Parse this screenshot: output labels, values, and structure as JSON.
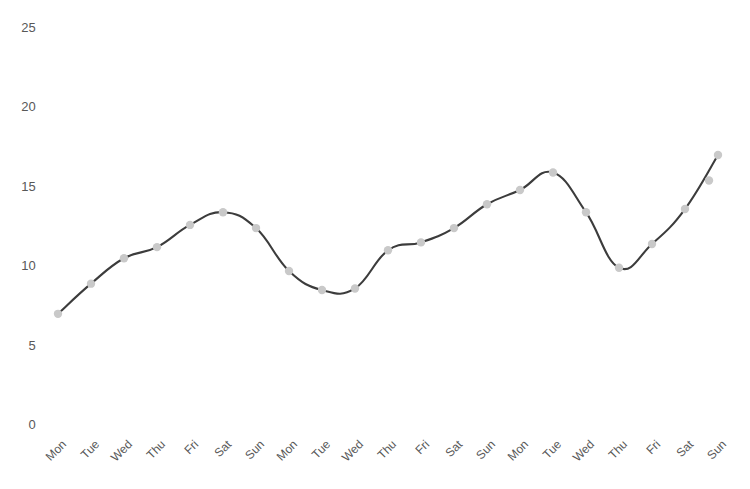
{
  "chart_data": {
    "type": "line",
    "title": "",
    "subtitle": "",
    "xlabel": "",
    "ylabel": "",
    "ylim": [
      0,
      25
    ],
    "grid": false,
    "legend": null,
    "y_ticks": [
      25,
      20,
      15,
      10,
      5,
      0
    ],
    "y_tick_labels": [
      "25",
      "20",
      "15",
      "10",
      "5",
      "0"
    ],
    "categories": [
      "Mon",
      "Tue",
      "Wed",
      "Thu",
      "Fri",
      "Sat",
      "Sun",
      "Mon",
      "Tue",
      "Wed",
      "Thu",
      "Fri",
      "Sat",
      "Sun",
      "Mon",
      "Tue",
      "Wed",
      "Thu",
      "Fri",
      "Sat",
      "Sun"
    ],
    "series": [
      {
        "name": "value",
        "marker": "circle",
        "marker_color": "#c9c9c9",
        "line_color": "#3c3c3c",
        "smoothing": "spline",
        "values": [
          7.0,
          8.9,
          10.5,
          11.2,
          12.6,
          13.4,
          12.4,
          9.7,
          8.5,
          8.6,
          11.0,
          11.5,
          12.4,
          13.9,
          14.8,
          15.9,
          13.4,
          9.9,
          11.4,
          13.6,
          17.0
        ]
      }
    ],
    "x_pixels": [
      58,
      95,
      139,
      175,
      200,
      237,
      250,
      277,
      292,
      328,
      360,
      378,
      394,
      430,
      455,
      473,
      510,
      536,
      594,
      634,
      688
    ],
    "marker_points": [
      {
        "label": "Mon",
        "value": 7.0
      },
      {
        "label": "Tue",
        "value": 8.9
      },
      {
        "label": "Wed",
        "value": 10.5
      },
      {
        "label": "Thu",
        "value": 11.2
      },
      {
        "label": "Fri",
        "value": 12.6
      },
      {
        "label": "Sat",
        "value": 13.4
      },
      {
        "label": "Sun",
        "value": 12.4
      },
      {
        "label": "Mon",
        "value": 9.7
      },
      {
        "label": "Tue",
        "value": 8.5
      },
      {
        "label": "Wed",
        "value": 8.6
      },
      {
        "label": "Thu",
        "value": 11.0
      },
      {
        "label": "Fri",
        "value": 11.5
      },
      {
        "label": "Sat",
        "value": 12.4
      },
      {
        "label": "Sun",
        "value": 13.9
      },
      {
        "label": "Mon",
        "value": 14.8
      },
      {
        "label": "Tue",
        "value": 15.9
      },
      {
        "label": "Wed",
        "value": 13.4
      },
      {
        "label": "Thu",
        "value": 9.9
      },
      {
        "label": "Fri",
        "value": 11.4
      },
      {
        "label": "Sat",
        "value": 13.6
      },
      {
        "label": "Sun",
        "value": 17.0
      },
      {
        "label": "Sun",
        "value": 15.4
      }
    ],
    "colors": {
      "line": "#3c3c3c",
      "marker": "#c9c9c9",
      "tick_text": "#585858",
      "background": "#ffffff"
    }
  }
}
